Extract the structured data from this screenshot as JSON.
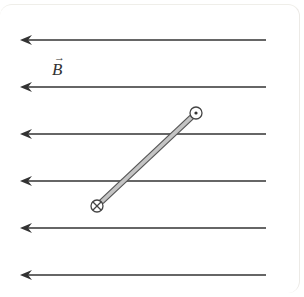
{
  "diagram": {
    "field_label": "B",
    "field_label_vector_arrow": "→",
    "field_direction": "left",
    "field_lines": [
      {
        "y": 40,
        "x1": 20,
        "x2": 266
      },
      {
        "y": 87,
        "x1": 20,
        "x2": 266
      },
      {
        "y": 134,
        "x1": 20,
        "x2": 266
      },
      {
        "y": 181,
        "x1": 20,
        "x2": 266
      },
      {
        "y": 228,
        "x1": 20,
        "x2": 266
      },
      {
        "y": 275,
        "x1": 20,
        "x2": 266
      }
    ],
    "rod": {
      "end_into_page": {
        "x": 97,
        "y": 206,
        "symbol": "⊗"
      },
      "end_out_of_page": {
        "x": 196,
        "y": 113,
        "symbol": "⊙"
      }
    },
    "colors": {
      "field_line": "#333333",
      "rod_fill": "#b8b8b8",
      "rod_outline": "#555555",
      "panel_border": "#ecebe6"
    }
  }
}
